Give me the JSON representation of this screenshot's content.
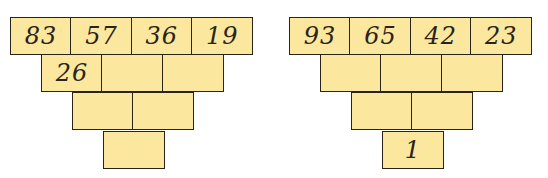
{
  "pyramids": [
    {
      "rows": [
        [
          "83",
          "57",
          "36",
          "19"
        ],
        [
          "26",
          "",
          ""
        ],
        [
          "",
          ""
        ],
        [
          ""
        ]
      ]
    },
    {
      "rows": [
        [
          "93",
          "65",
          "42",
          "23"
        ],
        [
          "",
          "",
          ""
        ],
        [
          "",
          ""
        ],
        [
          "1"
        ]
      ]
    }
  ],
  "colors": {
    "cell_fill": "#fbe79d",
    "border": "#2a2418"
  }
}
